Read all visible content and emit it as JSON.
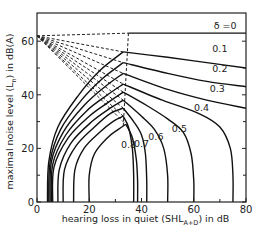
{
  "chart_data": {
    "type": "line",
    "title": "",
    "xlabel": "hearing loss in quiet (SHL_A+D) in dB",
    "xlabel_main": "hearing loss in quiet  (SHL",
    "xlabel_sub": "A+D",
    "xlabel_tail": ") in dB",
    "ylabel": "maximal noise level (L_n) in dB(A)",
    "ylabel_main": "maximal noise level  (L",
    "ylabel_sub": "n",
    "ylabel_tail": ") in dB(A)",
    "xlim": [
      0,
      80
    ],
    "ylim": [
      0,
      71
    ],
    "x_ticks": [
      0,
      20,
      40,
      60,
      80
    ],
    "x_tick_labels": [
      "0",
      "20",
      "40",
      "60",
      "80"
    ],
    "x_minor_ticks": [
      30,
      70
    ],
    "y_ticks": [
      0,
      20,
      40,
      60
    ],
    "y_tick_labels": [
      "0",
      "20",
      "40",
      "60"
    ],
    "y_minor_ticks": [
      10,
      30,
      50
    ],
    "grid": false,
    "legend": "none",
    "focal_point": [
      0,
      62
    ],
    "series": [
      {
        "name": "δ = 0",
        "label": "δ =0",
        "points": [
          [
            0,
            63
          ],
          [
            35,
            63
          ],
          [
            80,
            63
          ]
        ]
      },
      {
        "name": "δ = 0.1",
        "label": "0.1",
        "points": [
          [
            4,
            0
          ],
          [
            4.5,
            15
          ],
          [
            8,
            28
          ],
          [
            16,
            40
          ],
          [
            24,
            49
          ],
          [
            33,
            56
          ],
          [
            50,
            54
          ],
          [
            65,
            52
          ],
          [
            80,
            50
          ]
        ]
      },
      {
        "name": "δ = 0.2",
        "label": "0.2",
        "points": [
          [
            4.5,
            0
          ],
          [
            5,
            15
          ],
          [
            9,
            27
          ],
          [
            17,
            38
          ],
          [
            25,
            46
          ],
          [
            33,
            52
          ],
          [
            50,
            48
          ],
          [
            65,
            45
          ],
          [
            80,
            43
          ]
        ]
      },
      {
        "name": "δ = 0.3",
        "label": "0.3",
        "points": [
          [
            5,
            0
          ],
          [
            5.5,
            15
          ],
          [
            10,
            26
          ],
          [
            18,
            36
          ],
          [
            26,
            43
          ],
          [
            33,
            48
          ],
          [
            50,
            42
          ],
          [
            65,
            38
          ],
          [
            80,
            35
          ]
        ]
      },
      {
        "name": "δ = 0.4",
        "label": "0.4",
        "points": [
          [
            5.5,
            0
          ],
          [
            6,
            14
          ],
          [
            11,
            25
          ],
          [
            19,
            34
          ],
          [
            27,
            40
          ],
          [
            33,
            44
          ],
          [
            48,
            38
          ],
          [
            62,
            33
          ],
          [
            70,
            28
          ],
          [
            74,
            20
          ],
          [
            75,
            10
          ],
          [
            75,
            0
          ]
        ]
      },
      {
        "name": "δ = 0.5",
        "label": "0.5",
        "points": [
          [
            6,
            0
          ],
          [
            6.5,
            13
          ],
          [
            12,
            24
          ],
          [
            20,
            32
          ],
          [
            27,
            37
          ],
          [
            33,
            41
          ],
          [
            42,
            36
          ],
          [
            50,
            31
          ],
          [
            56,
            26
          ],
          [
            59,
            18
          ],
          [
            60,
            8
          ],
          [
            60,
            0
          ]
        ]
      },
      {
        "name": "δ = 0.6",
        "label": "0.6",
        "points": [
          [
            8,
            0
          ],
          [
            8.5,
            12
          ],
          [
            13,
            22
          ],
          [
            21,
            30
          ],
          [
            28,
            35
          ],
          [
            33,
            38
          ],
          [
            40,
            32
          ],
          [
            45,
            27
          ],
          [
            48.5,
            20
          ],
          [
            50,
            10
          ],
          [
            50,
            0
          ]
        ]
      },
      {
        "name": "δ = 0.7",
        "label": "0.7",
        "points": [
          [
            10,
            0
          ],
          [
            10.5,
            12
          ],
          [
            15,
            21
          ],
          [
            22,
            28
          ],
          [
            28,
            33
          ],
          [
            33,
            35
          ],
          [
            37,
            30
          ],
          [
            40,
            25
          ],
          [
            41.5,
            18
          ],
          [
            42,
            8
          ],
          [
            42,
            0
          ]
        ]
      },
      {
        "name": "δ = 0.8",
        "label": "0.8",
        "points": [
          [
            14,
            0
          ],
          [
            14.5,
            12
          ],
          [
            18,
            20
          ],
          [
            24,
            26
          ],
          [
            29,
            30
          ],
          [
            33,
            32
          ],
          [
            35,
            28
          ],
          [
            36.5,
            20
          ],
          [
            37,
            10
          ],
          [
            37,
            0
          ]
        ]
      },
      {
        "name": "δ = 0.9",
        "label": "",
        "points": [
          [
            20,
            0
          ],
          [
            20,
            10
          ],
          [
            22,
            18
          ],
          [
            27,
            24
          ],
          [
            31,
            27
          ],
          [
            34,
            29
          ],
          [
            36.5,
            24
          ],
          [
            38,
            16
          ],
          [
            38.5,
            8
          ],
          [
            38.5,
            0
          ]
        ]
      }
    ],
    "dashed_lines": [
      {
        "from": [
          0,
          62
        ],
        "to": [
          35,
          63
        ]
      },
      {
        "from": [
          0,
          62
        ],
        "to": [
          33,
          56
        ]
      },
      {
        "from": [
          0,
          62
        ],
        "to": [
          33,
          52
        ]
      },
      {
        "from": [
          0,
          62
        ],
        "to": [
          33,
          48
        ]
      },
      {
        "from": [
          0,
          62
        ],
        "to": [
          33,
          44
        ]
      },
      {
        "from": [
          0,
          62
        ],
        "to": [
          33,
          41
        ]
      },
      {
        "from": [
          0,
          62
        ],
        "to": [
          33,
          38
        ]
      },
      {
        "from": [
          0,
          62
        ],
        "to": [
          33,
          35
        ]
      },
      {
        "from": [
          0,
          62
        ],
        "to": [
          33,
          32
        ]
      },
      {
        "from": [
          0,
          62
        ],
        "to": [
          34,
          29
        ]
      },
      {
        "from": [
          35,
          63
        ],
        "to": [
          33,
          28
        ]
      }
    ],
    "annotations": [
      {
        "text": "δ =0",
        "x": 72,
        "y": 64.5
      },
      {
        "text": "0.1",
        "x": 70,
        "y": 56
      },
      {
        "text": "0.2",
        "x": 70,
        "y": 48.5
      },
      {
        "text": "0.3",
        "x": 69,
        "y": 41
      },
      {
        "text": "0.4",
        "x": 63,
        "y": 34
      },
      {
        "text": "0.5",
        "x": 54.5,
        "y": 26
      },
      {
        "text": "0.6",
        "x": 45.5,
        "y": 23
      },
      {
        "text": "0.7",
        "x": 40,
        "y": 20.5
      },
      {
        "text": "0.8",
        "x": 35,
        "y": 20
      }
    ]
  }
}
